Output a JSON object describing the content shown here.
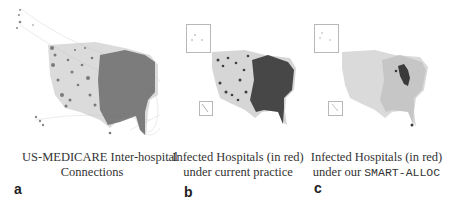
{
  "figure": {
    "panels": [
      {
        "label": "a",
        "caption_line1": "US-MEDICARE Inter-hospital",
        "caption_line2": "Connections",
        "content": "Map of continental US with dense hospital nodes and connection edges"
      },
      {
        "label": "b",
        "caption_line1": "Infected Hospitals (in red)",
        "caption_line2": "under current practice",
        "content": "Map with many infected hospitals concentrated in eastern and central US"
      },
      {
        "label": "c",
        "caption_line1": "Infected Hospitals (in red)",
        "caption_line2_prefix": "under our ",
        "caption_line2_code": "SMART-ALLOC",
        "content": "Map with small infected cluster in upper Midwest"
      }
    ],
    "colors": {
      "node_dense": "#6a6a6a",
      "node_light": "#d4d4d4",
      "infected": "#3a3a3a",
      "edge": "#c8c8c8",
      "inset_border": "#b8b8b8"
    }
  }
}
